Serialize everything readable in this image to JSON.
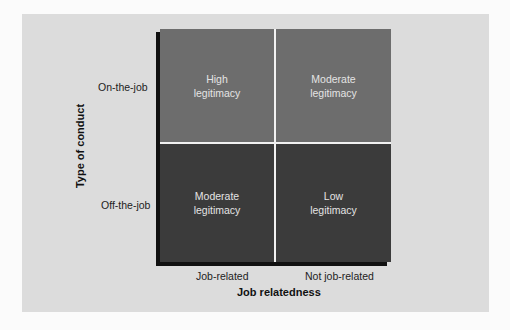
{
  "diagram": {
    "y_axis": {
      "title": "Type of conduct",
      "rows": [
        "On-the-job",
        "Off-the-job"
      ]
    },
    "x_axis": {
      "title": "Job relatedness",
      "columns": [
        "Job-related",
        "Not job-related"
      ]
    },
    "cells": [
      {
        "line1": "High",
        "line2": "legitimacy"
      },
      {
        "line1": "Moderate",
        "line2": "legitimacy"
      },
      {
        "line1": "Moderate",
        "line2": "legitimacy"
      },
      {
        "line1": "Low",
        "line2": "legitimacy"
      }
    ],
    "colors": {
      "top_row": "#6d6d6d",
      "bottom_row": "#3b3b3b",
      "panel": "#dcdcdc",
      "shadow": "#111111"
    }
  }
}
